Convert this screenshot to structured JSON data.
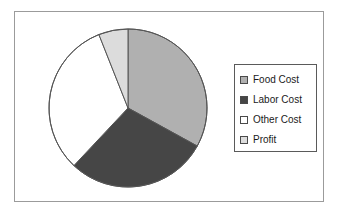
{
  "chart_data": {
    "type": "pie",
    "title": "",
    "labels": [
      "Food Cost",
      "Labor Cost",
      "Other Cost",
      "Profit"
    ],
    "values": [
      33,
      29,
      32,
      6
    ],
    "units": "percent",
    "colors": [
      "#b0b0b0",
      "#464646",
      "#ffffff",
      "#dcdcdc"
    ],
    "start_angle_deg": 0,
    "direction": "clockwise",
    "legend": {
      "position": "right",
      "entries": [
        {
          "label": "Food Cost",
          "color": "#b0b0b0"
        },
        {
          "label": "Labor Cost",
          "color": "#464646"
        },
        {
          "label": "Other Cost",
          "color": "#ffffff"
        },
        {
          "label": "Profit",
          "color": "#dcdcdc"
        }
      ]
    },
    "grid": false,
    "xlabel": "",
    "ylabel": ""
  },
  "frame": {
    "border_color": "#9b9b9b",
    "background": "#ffffff"
  },
  "pie": {
    "outline_color": "#555555",
    "center_x": 114,
    "center_y": 97,
    "radius": 79
  }
}
